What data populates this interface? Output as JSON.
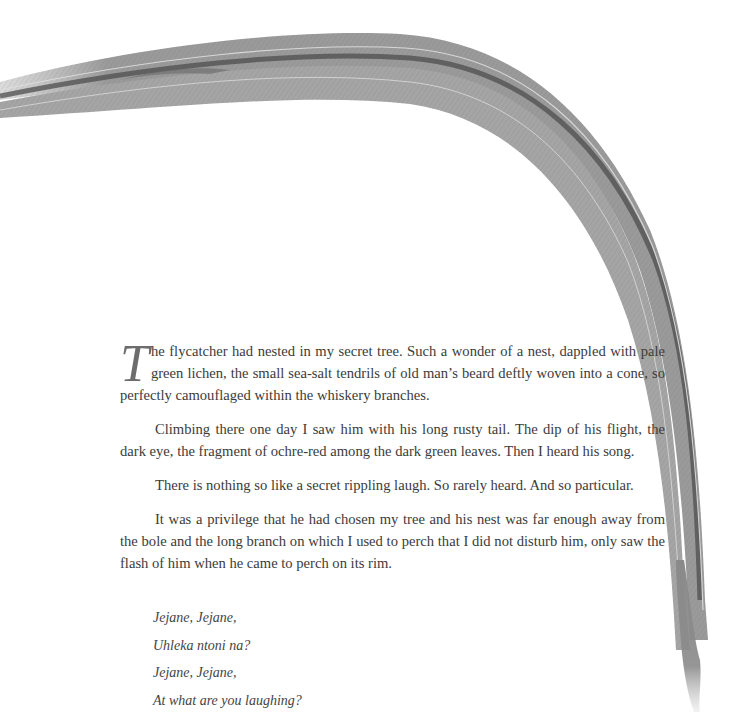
{
  "illustration": {
    "subject": "long rusty tail feather of flycatcher",
    "icon": "feather-icon",
    "tone": "graphite pencil",
    "colors": {
      "shadow": "#4a4a4a",
      "mid": "#8c8c8c",
      "light": "#c8c8c8"
    }
  },
  "story": {
    "dropcap": "T",
    "paragraphs": [
      "he flycatcher had nested in my secret tree. Such a wonder of a nest, dappled with pale green lichen, the small sea-salt tendrils of old man’s beard deftly woven into a cone, so perfectly camouflaged within the whiskery branches.",
      "Climbing there one day I saw him with his long rusty tail. The dip of his flight, the dark eye, the fragment of ochre-red among the dark green leaves. Then I heard his song.",
      "There is nothing so like a secret rippling laugh. So rarely heard. And so particular.",
      "It was a privilege that he had chosen my tree and his nest was far enough away from the bole and the long branch on which I used to perch that I did not disturb him, only saw the flash of him when he came to perch on its rim."
    ]
  },
  "poem": {
    "lines": [
      "Jejane, Jejane,",
      "Uhleka ntoni na?",
      "Jejane, Jejane,",
      "At what are you laughing?"
    ]
  }
}
